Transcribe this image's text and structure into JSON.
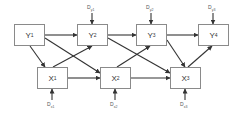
{
  "diagram": {
    "type": "cross-lagged path diagram",
    "nodes": {
      "Y1": {
        "base": "Y",
        "sub": "1"
      },
      "Y2": {
        "base": "Y",
        "sub": "2"
      },
      "Y3": {
        "base": "Y",
        "sub": "3"
      },
      "Y4": {
        "base": "Y",
        "sub": "4"
      },
      "X1": {
        "base": "X",
        "sub": "1"
      },
      "X2": {
        "base": "X",
        "sub": "2"
      },
      "X3": {
        "base": "X",
        "sub": "3"
      }
    },
    "disturbances": {
      "Dy1": {
        "base": "D",
        "sub": "y1",
        "target": "Y2"
      },
      "Dy2": {
        "base": "D",
        "sub": "y2",
        "target": "Y3"
      },
      "Dy3": {
        "base": "D",
        "sub": "y3",
        "target": "Y4"
      },
      "Dx1": {
        "base": "D",
        "sub": "x1",
        "target": "X1"
      },
      "Dx2": {
        "base": "D",
        "sub": "x2",
        "target": "X2"
      },
      "Dx3": {
        "base": "D",
        "sub": "x3",
        "target": "X3"
      }
    },
    "edges": [
      {
        "from": "Y1",
        "to": "Y2"
      },
      {
        "from": "Y2",
        "to": "Y3"
      },
      {
        "from": "Y3",
        "to": "Y4"
      },
      {
        "from": "X1",
        "to": "X2"
      },
      {
        "from": "X2",
        "to": "X3"
      },
      {
        "from": "Y1",
        "to": "X1"
      },
      {
        "from": "Y1",
        "to": "X2"
      },
      {
        "from": "X1",
        "to": "Y2"
      },
      {
        "from": "Y2",
        "to": "X3"
      },
      {
        "from": "X2",
        "to": "Y3"
      },
      {
        "from": "Y3",
        "to": "X3"
      },
      {
        "from": "X3",
        "to": "Y4"
      }
    ],
    "colors": {
      "line": "#333333",
      "border": "#8a8a8a",
      "text": "#333333"
    }
  }
}
